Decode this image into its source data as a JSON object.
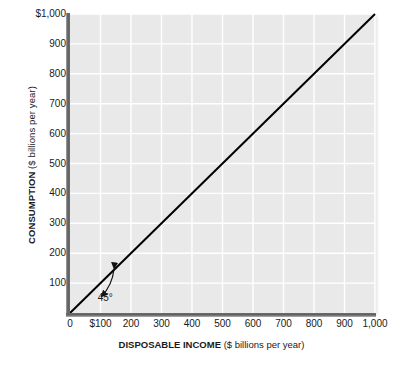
{
  "chart_data": {
    "type": "line",
    "title": "",
    "xlabel_bold": "DISPOSABLE INCOME",
    "xlabel_light": "($ billions per year)",
    "ylabel_bold": "CONSUMPTION",
    "ylabel_light": "($ billions per year)",
    "xlim": [
      0,
      1000
    ],
    "ylim": [
      0,
      1000
    ],
    "grid": true,
    "legend": "none",
    "plot_background": "#e9e9e9",
    "grid_color": "#ffffff",
    "line_color": "#000000",
    "x_ticks": [
      {
        "value": 0,
        "label": "0"
      },
      {
        "value": 100,
        "label": "$100"
      },
      {
        "value": 200,
        "label": "200"
      },
      {
        "value": 300,
        "label": "300"
      },
      {
        "value": 400,
        "label": "400"
      },
      {
        "value": 500,
        "label": "500"
      },
      {
        "value": 600,
        "label": "600"
      },
      {
        "value": 700,
        "label": "700"
      },
      {
        "value": 800,
        "label": "800"
      },
      {
        "value": 900,
        "label": "900"
      },
      {
        "value": 1000,
        "label": "1,000"
      }
    ],
    "y_ticks": [
      {
        "value": 100,
        "label": "100"
      },
      {
        "value": 200,
        "label": "200"
      },
      {
        "value": 300,
        "label": "300"
      },
      {
        "value": 400,
        "label": "400"
      },
      {
        "value": 500,
        "label": "500"
      },
      {
        "value": 600,
        "label": "600"
      },
      {
        "value": 700,
        "label": "700"
      },
      {
        "value": 800,
        "label": "800"
      },
      {
        "value": 900,
        "label": "900"
      },
      {
        "value": 1000,
        "label": "$1,000"
      }
    ],
    "series": [
      {
        "name": "45-degree line",
        "x": [
          0,
          1000
        ],
        "values": [
          0,
          1000
        ]
      }
    ],
    "annotations": [
      {
        "name": "angle-label",
        "text": "45°",
        "x": 130,
        "y": 50
      }
    ]
  }
}
